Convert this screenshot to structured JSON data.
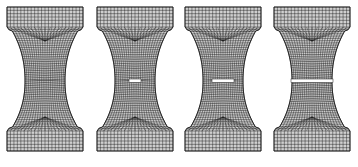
{
  "figure": {
    "background": "#ffffff",
    "line_color": "#1a1a1a",
    "specimens": [
      {
        "id": "stage-1",
        "x": 7,
        "crack_width": 0
      },
      {
        "id": "stage-2",
        "x": 97,
        "crack_width": 12
      },
      {
        "id": "stage-3",
        "x": 185,
        "crack_width": 22
      },
      {
        "id": "stage-4",
        "x": 274,
        "crack_width": 76
      }
    ],
    "geometry": {
      "width": 76,
      "top": 7,
      "bottom": 151,
      "grip_height": 20,
      "shoulder_height": 10,
      "neck_min_half_width": 20,
      "neck_y": 81,
      "cols": 22,
      "grip_rows": 6
    }
  }
}
